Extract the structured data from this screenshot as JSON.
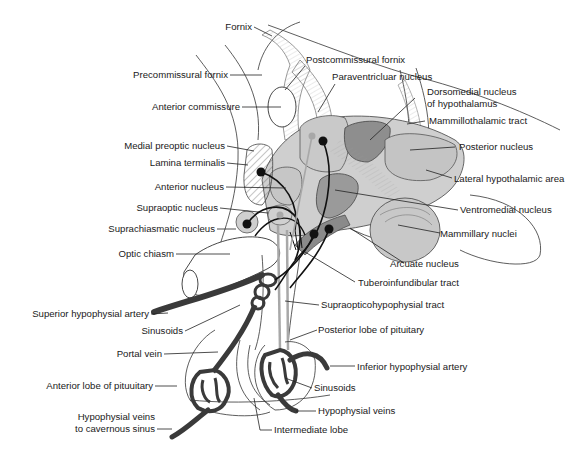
{
  "diagram": {
    "colors": {
      "light_nucleus": "#d4d4d4",
      "medium_nucleus": "#bdbdbd",
      "dark_nucleus": "#8e8e8e",
      "vessel": "#3a3a3a",
      "neuron_tract": "#111111",
      "gray_tract": "#a8a8a8",
      "background": "#ffffff"
    },
    "labels": {
      "fornix": "Fornix",
      "precommissural_fornix": "Precommissural fornix",
      "anterior_commissure": "Anterior commissure",
      "postcommissural_fornix": "Postcommissural fornix",
      "paraventricular_nucleus": "Paraventricluar nucleus",
      "dorsomedial_nucleus_1": "Dorsomedial nucleus",
      "dorsomedial_nucleus_2": "of hypothalamus",
      "mammillothalamic_tract": "Mammillothalamic tract",
      "posterior_nucleus": "Posterior nucleus",
      "lateral_hypothalamic_area": "Lateral hypothalamic area",
      "ventromedial_nucleus": "Ventromedial nucleus",
      "mammillary_nuclei": "Mammillary nuclei",
      "arcuate_nucleus": "Arcuate nucleus",
      "tuberoinfundibular_tract": "Tuberoinfundibular tract",
      "supraopticohypophysial_tract": "Supraopticohypophysial tract",
      "posterior_lobe": "Posterior lobe of pituitary",
      "inferior_hypophysial_artery": "Inferior hypophysial artery",
      "sinusoids_right": "Sinusoids",
      "hypophysial_veins_right": "Hypophysial veins",
      "intermediate_lobe": "Intermediate lobe",
      "medial_preoptic_nucleus": "Medial preoptic nucleus",
      "lamina_terminalis": "Lamina terminalis",
      "anterior_nucleus": "Anterior nucleus",
      "supraoptic_nucleus": "Supraoptic nucleus",
      "suprachiasmatic_nucleus": "Suprachiasmatic nucleus",
      "optic_chiasm": "Optic chiasm",
      "superior_hypophysial_artery": "Superior hypophysial artery",
      "sinusoids_left": "Sinusoids",
      "portal_vein": "Portal vein",
      "anterior_lobe": "Anterior lobe of pituuitary",
      "hypophysial_veins_left_1": "Hypophysial veins",
      "hypophysial_veins_left_2": "to cavernous sinus"
    }
  }
}
